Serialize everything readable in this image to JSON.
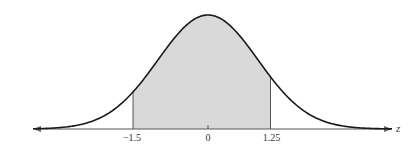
{
  "chart_data": {
    "type": "area",
    "title": "",
    "xlabel": "z",
    "ylabel": "",
    "distribution": {
      "name": "standard normal",
      "mean": 0,
      "sd": 1
    },
    "shaded_region": {
      "from": -1.5,
      "to": 1.25
    },
    "tick_labels": [
      "-1.5",
      "0",
      "1.25"
    ],
    "ticks": [
      -1.5,
      0,
      1.25
    ],
    "xlim": [
      -3.5,
      3.7
    ],
    "grid": false,
    "legend": null,
    "colors": {
      "curve": "#1a1a1a",
      "shade": "#d9d9d9",
      "axis": "#555555",
      "boundary": "#555555"
    }
  },
  "labels": {
    "tick_neg": "−1.5",
    "tick_zero": "0",
    "tick_pos": "1.25",
    "axis_var": "z"
  }
}
